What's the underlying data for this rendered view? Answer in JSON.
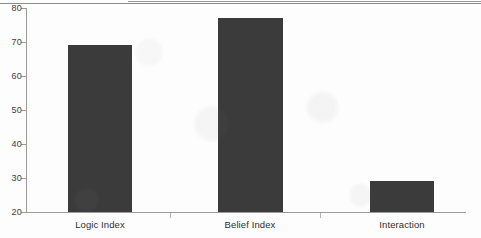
{
  "chart_data": {
    "type": "bar",
    "title": "",
    "subtitle": "",
    "xlabel": "",
    "ylabel": "",
    "categories": [
      "Logic Index",
      "Belief Index",
      "Interaction"
    ],
    "values": [
      69,
      77,
      29
    ],
    "series": [
      {
        "name": "",
        "values": [
          69,
          77,
          29
        ]
      }
    ],
    "ylim": [
      20,
      80
    ],
    "yticks": [
      20,
      30,
      40,
      50,
      60,
      70,
      80
    ],
    "ytick_labels": [
      "20",
      "30",
      "40",
      "50",
      "60",
      "70",
      "80"
    ],
    "grid": false,
    "legend": false,
    "legend_position": "none",
    "bar_color": "#3b3b3b",
    "axis_color": "#9b9b9b",
    "background_color": "#fdfdfd",
    "annotations": []
  },
  "axis": {
    "y_tick_labels": [
      "80",
      "70",
      "60",
      "50",
      "40",
      "30",
      "20"
    ]
  },
  "categories": {
    "items": [
      {
        "label": "Logic Index"
      },
      {
        "label": "Belief Index"
      },
      {
        "label": "Interaction"
      }
    ]
  }
}
